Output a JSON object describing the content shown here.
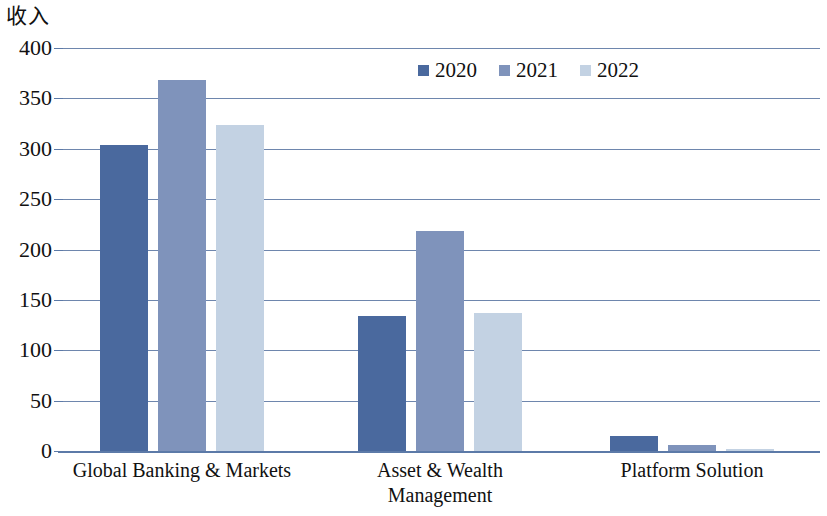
{
  "chart_data": {
    "type": "bar",
    "title": "",
    "ylabel": "收入",
    "xlabel": "",
    "categories": [
      "Global Banking & Markets",
      "Asset & Wealth Management",
      "Platform Solution"
    ],
    "series": [
      {
        "name": "2020",
        "color": "#4a699e",
        "values": [
          304,
          134,
          15
        ]
      },
      {
        "name": "2021",
        "color": "#7f93bb",
        "values": [
          368,
          218,
          6
        ]
      },
      {
        "name": "2022",
        "color": "#c3d2e3",
        "values": [
          324,
          137,
          2
        ]
      }
    ],
    "ylim": [
      0,
      400
    ],
    "y_ticks": [
      "400",
      "350",
      "300",
      "250",
      "200",
      "150",
      "100",
      "50",
      "0"
    ],
    "grid": true,
    "legend_position": "top-center",
    "grid_color": "#6e86ad"
  },
  "axis": {
    "y_title": "收入",
    "ticks": [
      {
        "label": "400",
        "value": 400
      },
      {
        "label": "350",
        "value": 350
      },
      {
        "label": "300",
        "value": 300
      },
      {
        "label": "250",
        "value": 250
      },
      {
        "label": "200",
        "value": 200
      },
      {
        "label": "150",
        "value": 150
      },
      {
        "label": "100",
        "value": 100
      },
      {
        "label": "50",
        "value": 50
      },
      {
        "label": "0",
        "value": 0
      }
    ]
  },
  "legend": {
    "items": [
      {
        "label": "2020",
        "color": "#4a699e"
      },
      {
        "label": "2021",
        "color": "#7f93bb"
      },
      {
        "label": "2022",
        "color": "#c3d2e3"
      }
    ]
  },
  "categories": [
    {
      "lines": [
        "Global Banking & Markets"
      ]
    },
    {
      "lines": [
        "Asset & Wealth",
        "Management"
      ]
    },
    {
      "lines": [
        "Platform Solution"
      ]
    }
  ]
}
